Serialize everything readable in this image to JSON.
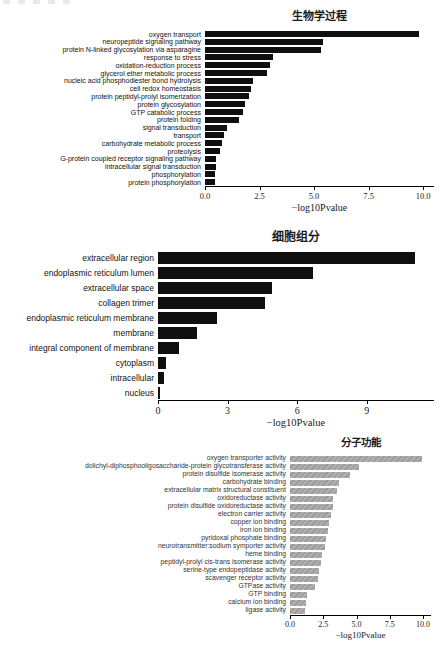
{
  "figure": {
    "background": "#ffffff",
    "bar_color_black": "#0f0f0f",
    "bar_color_gray": "#a5a5a5"
  },
  "chart_data": [
    {
      "type": "bar",
      "orientation": "horizontal",
      "title": "生物学过程",
      "xlabel": "−log10Pvalue",
      "bar_color": "#0f0f0f",
      "bar_style": "solid",
      "xlim": [
        0,
        10.5
      ],
      "grid": false,
      "xticks": {
        "labels": [
          "0.0",
          "2.5",
          "5.0",
          "7.5",
          "10.0"
        ],
        "values": [
          0,
          2.5,
          5,
          7.5,
          10
        ]
      },
      "categories": [
        "oxygen transport",
        "neuropeptide signaling pathway",
        "protein N-linked glycosylation via asparagine",
        "response to stress",
        "oxidation-reduction process",
        "glycerol ether metabolic process",
        "nucleic acid phosphodiester bond hydrolysis",
        "cell redox homeostasis",
        "protein peptidyl-prolyl isomerization",
        "protein glycosylation",
        "GTP catabolic process",
        "protein folding",
        "signal transduction",
        "transport",
        "carbohydrate metabolic process",
        "proteolysis",
        "G-protein coupled receptor signaling pathway",
        "intracellular signal transduction",
        "phosphorylation",
        "protein phosphorylation"
      ],
      "values": [
        9.8,
        5.4,
        5.3,
        3.1,
        3.0,
        2.85,
        2.2,
        2.1,
        2.0,
        1.85,
        1.75,
        1.55,
        1.0,
        0.85,
        0.77,
        0.71,
        0.5,
        0.5,
        0.45,
        0.45
      ]
    },
    {
      "type": "bar",
      "orientation": "horizontal",
      "title": "细胞组分",
      "xlabel": "−log10Pvalue",
      "bar_color": "#0f0f0f",
      "bar_style": "solid",
      "xlim": [
        0,
        11.9
      ],
      "grid": false,
      "xticks": {
        "labels": [
          "0",
          "3",
          "6",
          "9"
        ],
        "values": [
          0,
          3,
          6,
          9
        ]
      },
      "categories": [
        "extracellular region",
        "endoplasmic reticulum lumen",
        "extracellular space",
        "collagen trimer",
        "endoplasmic reticulum membrane",
        "membrane",
        "integral component of membrane",
        "cytoplasm",
        "intracellular",
        "nucleus"
      ],
      "values": [
        11.1,
        6.7,
        4.9,
        4.6,
        2.55,
        1.7,
        0.9,
        0.35,
        0.25,
        0.07
      ]
    },
    {
      "type": "bar",
      "orientation": "horizontal",
      "title": "分子功能",
      "xlabel": "−log10Pvalue",
      "bar_color": "#a5a5a5",
      "bar_style": "hatched",
      "xlim": [
        0,
        10.6
      ],
      "grid": false,
      "xticks": {
        "labels": [
          "0.0",
          "2.5",
          "5.0",
          "7.5",
          "10.0"
        ],
        "values": [
          0,
          2.5,
          5,
          7.5,
          10
        ]
      },
      "categories": [
        "oxygen transporter activity",
        "dolichyl-diphosphooligosaccharide-protein glycotransferase activity",
        "protein disulfide isomerase activity",
        "carbohydrate binding",
        "extracellular matrix structural constituent",
        "oxidoreductase activity",
        "protein disulfide oxidoreductase activity",
        "electron carrier activity",
        "copper ion binding",
        "iron ion binding",
        "pyridoxal phosphate binding",
        "neurotransmitter:sodium symporter activity",
        "heme binding",
        "peptidyl-prolyl cis-trans isomerase activity",
        "serine-type endopeptidase activity",
        "scavenger receptor activity",
        "GTPase activity",
        "GTP binding",
        "calcium ion binding",
        "ligase activity"
      ],
      "values": [
        9.9,
        5.2,
        4.5,
        3.7,
        3.5,
        3.2,
        3.2,
        3.1,
        2.9,
        2.85,
        2.7,
        2.6,
        2.4,
        2.3,
        2.2,
        2.1,
        1.9,
        1.3,
        1.2,
        1.15
      ]
    }
  ]
}
